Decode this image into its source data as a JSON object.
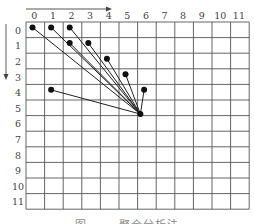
{
  "diagram": {
    "cols": 12,
    "rows": 12,
    "col_labels": [
      "0",
      "1",
      "2",
      "3",
      "4",
      "5",
      "6",
      "7",
      "8",
      "9",
      "10",
      "11"
    ],
    "row_labels": [
      "0",
      "1",
      "2",
      "3",
      "4",
      "5",
      "6",
      "7",
      "8",
      "9",
      "10",
      "11"
    ],
    "x_arrow": "right",
    "y_arrow": "down",
    "target_point": {
      "col": 6,
      "row": 6
    },
    "source_points": [
      {
        "col": 0,
        "row": 0
      },
      {
        "col": 1,
        "row": 0
      },
      {
        "col": 2,
        "row": 0
      },
      {
        "col": 2,
        "row": 1
      },
      {
        "col": 3,
        "row": 1
      },
      {
        "col": 4,
        "row": 2
      },
      {
        "col": 5,
        "row": 3
      },
      {
        "col": 6,
        "row": 4
      },
      {
        "col": 1,
        "row": 4
      }
    ],
    "colors": {
      "grid": "#555555",
      "line": "#222222",
      "point": "#111111",
      "text": "#444444"
    }
  },
  "caption": "图 …… 聚合分析法"
}
